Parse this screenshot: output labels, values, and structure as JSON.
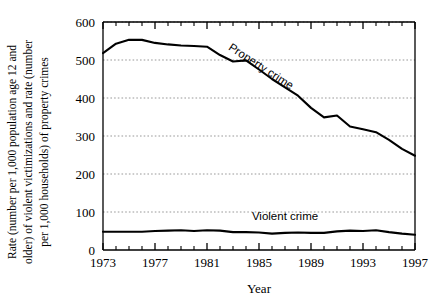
{
  "chart_data": {
    "type": "line",
    "title": "",
    "xlabel": "Year",
    "ylabel": "Rate (number per 1,000 population age 12 and older) of violent victimizations and rate (number per 1,000 households) of property crimes",
    "ylabel_lines": [
      "Rate (number per 1,000 population age 12 and",
      "older) of violent victimizations and rate (number",
      "per 1,000 households) of property crimes"
    ],
    "xlim": [
      1973,
      1997
    ],
    "ylim": [
      0,
      600
    ],
    "grid": "horizontal-dotted",
    "legend_position": "inline-annotation",
    "x_tick_labels": [
      "1973",
      "1977",
      "1981",
      "1985",
      "1989",
      "1993",
      "1997"
    ],
    "x_tick_values": [
      1973,
      1977,
      1981,
      1985,
      1989,
      1993,
      1997
    ],
    "x_minor_ticks": [
      1974,
      1975,
      1976,
      1978,
      1979,
      1980,
      1982,
      1983,
      1984,
      1986,
      1987,
      1988,
      1990,
      1991,
      1992,
      1994,
      1995,
      1996
    ],
    "y_tick_labels": [
      "0",
      "100",
      "200",
      "300",
      "400",
      "500",
      "600"
    ],
    "y_tick_values": [
      0,
      100,
      200,
      300,
      400,
      500,
      600
    ],
    "x": [
      1973,
      1974,
      1975,
      1976,
      1977,
      1978,
      1979,
      1980,
      1981,
      1982,
      1983,
      1984,
      1985,
      1986,
      1987,
      1988,
      1989,
      1990,
      1991,
      1992,
      1993,
      1994,
      1995,
      1996,
      1997
    ],
    "series": [
      {
        "name": "Property crime",
        "label": "Property crime",
        "color": "#000000",
        "values": [
          518,
          543,
          553,
          553,
          545,
          541,
          538,
          537,
          535,
          513,
          496,
          499,
          475,
          450,
          428,
          406,
          374,
          349,
          354,
          325,
          318,
          310,
          290,
          266,
          248
        ]
      },
      {
        "name": "Violent crime",
        "label": "Violent crime",
        "color": "#000000",
        "values": [
          48,
          48,
          48,
          48,
          50,
          51,
          52,
          50,
          52,
          51,
          47,
          47,
          46,
          43,
          45,
          46,
          45,
          45,
          49,
          51,
          50,
          52,
          47,
          43,
          40
        ]
      }
    ],
    "annotations": [
      {
        "text": "Property crime",
        "x": 1985,
        "y": 475,
        "rotation": 33
      },
      {
        "text": "Violent crime",
        "x": 1987,
        "y": 78,
        "rotation": 0
      }
    ]
  }
}
